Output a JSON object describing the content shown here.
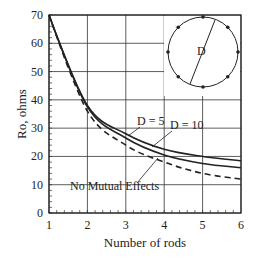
{
  "chart_data": {
    "type": "line",
    "title": "",
    "xlabel": "Number of rods",
    "ylabel": "Ro, ohms",
    "xlim": [
      1,
      6
    ],
    "ylim": [
      0,
      70
    ],
    "x": [
      1,
      2,
      3,
      4,
      5,
      6
    ],
    "xticks": [
      "1",
      "2",
      "3",
      "4",
      "5",
      "6"
    ],
    "yticks": [
      "0",
      "10",
      "20",
      "30",
      "40",
      "50",
      "60",
      "70"
    ],
    "grid": true,
    "series": [
      {
        "name": "D = 5",
        "style": "solid",
        "values": [
          70,
          38,
          28,
          22.5,
          20,
          18.5
        ]
      },
      {
        "name": "D = 10",
        "style": "solid",
        "values": [
          70,
          37.5,
          26.5,
          20.5,
          17.5,
          16
        ]
      },
      {
        "name": "No Mutual Effects",
        "style": "dashed",
        "values": [
          70,
          36,
          24,
          18,
          14,
          12
        ]
      }
    ],
    "annotations": [
      "D = 5",
      "D = 10",
      "No Mutual Effects",
      "D"
    ],
    "inset": {
      "description": "circle of rods with diameter D",
      "label": "D",
      "rod_count": 8
    }
  }
}
